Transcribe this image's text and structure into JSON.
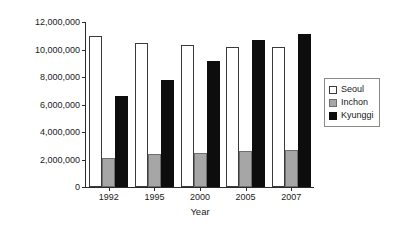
{
  "chart_data": {
    "type": "bar",
    "title": "",
    "xlabel": "Year",
    "ylabel": "Persons",
    "categories": [
      "1992",
      "1995",
      "2000",
      "2005",
      "2007"
    ],
    "series": [
      {
        "name": "Seoul",
        "color": "#ffffff",
        "values": [
          10950000,
          10500000,
          10300000,
          10200000,
          10200000
        ]
      },
      {
        "name": "Inchon",
        "color": "#a6a6a6",
        "values": [
          2100000,
          2400000,
          2500000,
          2600000,
          2680000
        ]
      },
      {
        "name": "Kyunggi",
        "color": "#0d0d0d",
        "values": [
          6600000,
          7800000,
          9200000,
          10700000,
          11100000
        ]
      }
    ],
    "ylim": [
      0,
      12000000
    ],
    "ytick_labels": [
      "0",
      "2,000,000",
      "4,000,000",
      "6,000,000",
      "8,000,000",
      "10,000,000",
      "12,000,000"
    ],
    "ytick_values": [
      0,
      2000000,
      4000000,
      6000000,
      8000000,
      10000000,
      12000000
    ],
    "grid": false,
    "legend_position": "right"
  }
}
